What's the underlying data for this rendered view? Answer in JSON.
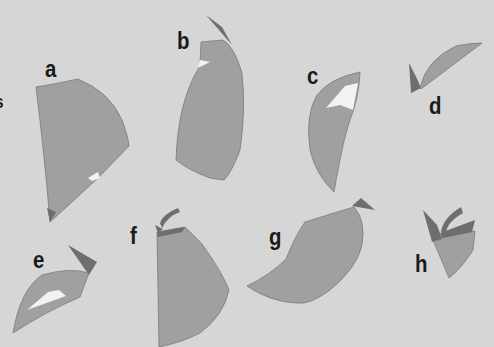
{
  "figure": {
    "background_color": "#d6d6d6",
    "colors": {
      "body": "#a0a0a0",
      "dark_tip": "#6e6e6e",
      "highlight": "#f2f2f2",
      "label": "#1a1a1a"
    },
    "edge_fragment_label": "s",
    "panels": [
      {
        "id": "a",
        "label": "a"
      },
      {
        "id": "b",
        "label": "b"
      },
      {
        "id": "c",
        "label": "c"
      },
      {
        "id": "d",
        "label": "d"
      },
      {
        "id": "e",
        "label": "e"
      },
      {
        "id": "f",
        "label": "f"
      },
      {
        "id": "g",
        "label": "g"
      },
      {
        "id": "h",
        "label": "h"
      }
    ]
  }
}
